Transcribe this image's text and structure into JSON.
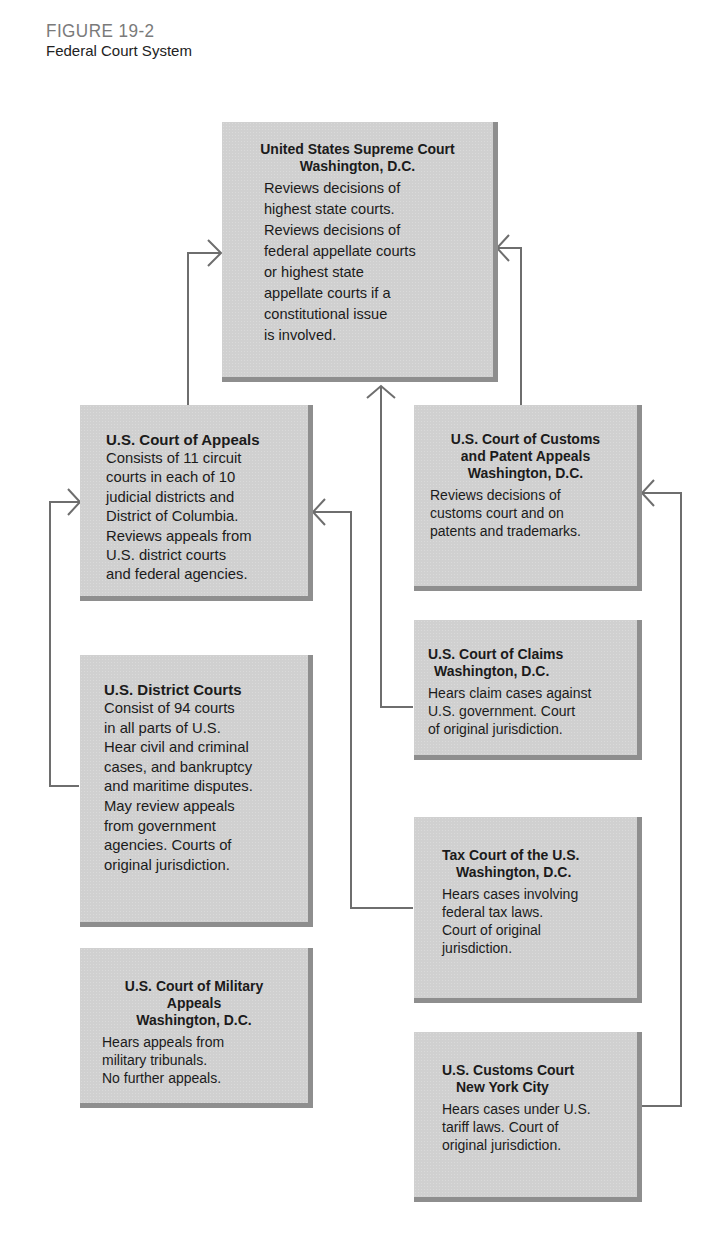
{
  "figure": {
    "label": "FIGURE 19-2",
    "title": "Federal Court System"
  },
  "boxes": {
    "supreme": {
      "title": "United States Supreme Court",
      "location": "Washington, D.C.",
      "lines": [
        "Reviews decisions of",
        "highest state courts.",
        "Reviews decisions of",
        "federal appellate courts",
        "or highest state",
        "appellate courts if a",
        "constitutional issue",
        "is involved."
      ]
    },
    "appeals": {
      "title": "U.S. Court of Appeals",
      "lines": [
        "Consists of 11 circuit",
        "courts in each of 10",
        "judicial districts and",
        "District of Columbia.",
        "Reviews appeals from",
        "U.S. district courts",
        "and federal agencies."
      ]
    },
    "customs_patent": {
      "title_lines": [
        "U.S. Court of Customs",
        "and Patent Appeals"
      ],
      "location": "Washington, D.C.",
      "lines": [
        "Reviews decisions of",
        "customs court and on",
        "patents and trademarks."
      ]
    },
    "claims": {
      "title": "U.S. Court of Claims",
      "location": "Washington, D.C.",
      "lines": [
        "Hears claim cases against",
        "U.S. government.  Court",
        "of original jurisdiction."
      ]
    },
    "district": {
      "title": "U.S. District Courts",
      "lines": [
        "Consist of 94 courts",
        "in all parts of U.S.",
        "Hear civil and criminal",
        "cases, and bankruptcy",
        "and maritime disputes.",
        "May review appeals",
        "from government",
        "agencies.  Courts of",
        "original jurisdiction."
      ]
    },
    "tax": {
      "title": "Tax Court of the U.S.",
      "location": "Washington, D.C.",
      "lines": [
        "Hears cases involving",
        "federal tax laws.",
        "Court of original",
        "jurisdiction."
      ]
    },
    "military": {
      "title_lines": [
        "U.S. Court of Military",
        "Appeals"
      ],
      "location": "Washington, D.C.",
      "lines": [
        "Hears appeals from",
        "military tribunals.",
        "No further appeals."
      ]
    },
    "customs_court": {
      "title": "U.S. Customs Court",
      "location": "New York City",
      "lines": [
        "Hears cases under U.S.",
        "tariff laws.  Court of",
        "original jurisdiction."
      ]
    }
  },
  "connections": [
    {
      "from": "U.S. Court of Appeals",
      "to": "United States Supreme Court"
    },
    {
      "from": "U.S. Court of Customs and Patent Appeals",
      "to": "United States Supreme Court"
    },
    {
      "from": "U.S. Court of Claims",
      "to": "United States Supreme Court"
    },
    {
      "from": "U.S. District Courts",
      "to": "U.S. Court of Appeals"
    },
    {
      "from": "Tax Court of the U.S.",
      "to": "U.S. Court of Appeals"
    },
    {
      "from": "U.S. Customs Court",
      "to": "U.S. Court of Customs and Patent Appeals"
    }
  ],
  "colors": {
    "box_fill": "#d0d0d0",
    "box_shadow": "#8e8e8e",
    "line": "#6e6e6e",
    "label_gray": "#7a7a7a"
  }
}
